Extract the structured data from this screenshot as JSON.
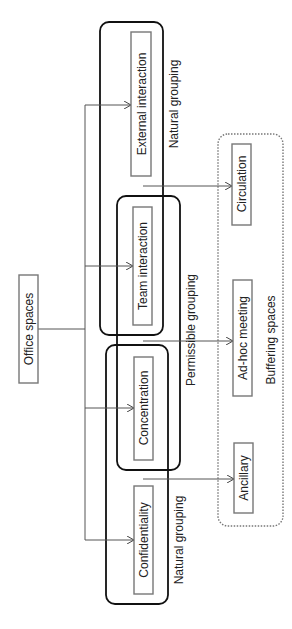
{
  "diagram": {
    "root": {
      "label": "Office spaces"
    },
    "office_spaces": [
      {
        "id": "external",
        "label": "External interaction"
      },
      {
        "id": "team",
        "label": "Team interaction"
      },
      {
        "id": "concentration",
        "label": "Concentration"
      },
      {
        "id": "confidentiality",
        "label": "Confidentiality"
      }
    ],
    "groupings": {
      "top_natural": "Natural grouping",
      "permissible": "Permissible grouping",
      "bottom_natural": "Natural grouping"
    },
    "buffering": {
      "title": "Buffering spaces",
      "items": [
        {
          "id": "circulation",
          "label": "Circulation"
        },
        {
          "id": "adhoc",
          "label": "Ad-hoc meeting"
        },
        {
          "id": "ancillary",
          "label": "Ancillary"
        }
      ]
    }
  }
}
